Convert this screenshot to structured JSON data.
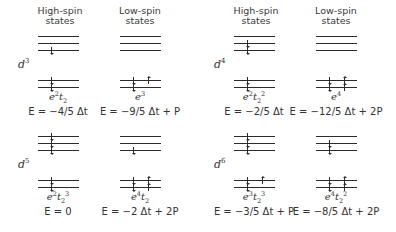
{
  "headers": {
    "high_spin": "High-spin states",
    "low_spin": "Low-spin states"
  },
  "panels": [
    {
      "d": "d",
      "n": "3",
      "high": {
        "t2": [
          [
            1
          ],
          [
            0
          ],
          [
            0
          ]
        ],
        "e": [
          [
            1
          ],
          [
            1
          ]
        ],
        "cfg": "e²t₂",
        "cfg_html": "e<sup>2</sup>t<sub>2</sub>",
        "energy": "E = −4/5 Δt"
      },
      "low": {
        "t2": [
          [
            0
          ],
          [
            0
          ],
          [
            0
          ]
        ],
        "e": [
          [
            1
          ],
          [
            1,
            1
          ]
        ],
        "cfg": "e³",
        "cfg_html": "e<sup>3</sup>",
        "energy": "E = −9/5 Δt + P"
      }
    },
    {
      "d": "d",
      "n": "4",
      "high": {
        "t2": [
          [
            1
          ],
          [
            1
          ],
          [
            0
          ]
        ],
        "e": [
          [
            1
          ],
          [
            1
          ]
        ],
        "cfg": "e²t₂²",
        "cfg_html": "e<sup>2</sup>t<sub>2</sub><sup>2</sup>",
        "energy": "E = −2/5 Δt"
      },
      "low": {
        "t2": [
          [
            0
          ],
          [
            0
          ],
          [
            0
          ]
        ],
        "e": [
          [
            1,
            1
          ],
          [
            1,
            1
          ]
        ],
        "cfg": "e⁴",
        "cfg_html": "e<sup>4</sup>",
        "energy": "E = −12/5 Δt + 2P"
      }
    },
    {
      "d": "d",
      "n": "5",
      "high": {
        "t2": [
          [
            1
          ],
          [
            1
          ],
          [
            1
          ]
        ],
        "e": [
          [
            1
          ],
          [
            1
          ]
        ],
        "cfg": "e²t₂³",
        "cfg_html": "e<sup>2</sup>t<sub>2</sub><sup>3</sup>",
        "energy": "E = 0"
      },
      "low": {
        "t2": [
          [
            1
          ],
          [
            0
          ],
          [
            0
          ]
        ],
        "e": [
          [
            1,
            1
          ],
          [
            1,
            1
          ]
        ],
        "cfg": "e⁴t₂",
        "cfg_html": "e<sup>4</sup>t<sub>2</sub>",
        "energy": "E = −2 Δt + 2P"
      }
    },
    {
      "d": "d",
      "n": "6",
      "high": {
        "t2": [
          [
            1
          ],
          [
            1
          ],
          [
            1
          ]
        ],
        "e": [
          [
            1
          ],
          [
            1,
            1
          ]
        ],
        "cfg": "e³t₂³",
        "cfg_html": "e<sup>3</sup>t<sub>2</sub><sup>3</sup>",
        "energy": "E = −3/5 Δt + P"
      },
      "low": {
        "t2": [
          [
            1
          ],
          [
            1
          ],
          [
            0
          ]
        ],
        "e": [
          [
            1,
            1
          ],
          [
            1,
            1
          ]
        ],
        "cfg": "e⁴t₂²",
        "cfg_html": "e<sup>4</sup>t<sub>2</sub><sup>2</sup>",
        "energy": "E = −8/5 Δt + 2P"
      }
    }
  ]
}
